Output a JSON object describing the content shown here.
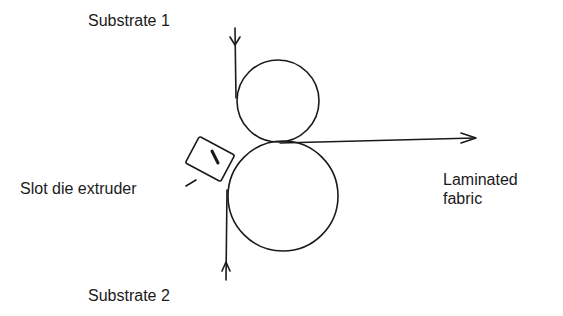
{
  "labels": {
    "substrate_1": "Substrate 1",
    "substrate_2": "Substrate 2",
    "slot_die_extruder": "Slot die extruder",
    "output_line1": "Laminated",
    "output_line2": "fabric"
  },
  "components": {
    "upper_roller": {
      "cx": 278,
      "cy": 101,
      "r": 41
    },
    "lower_roller": {
      "cx": 283,
      "cy": 196,
      "r": 55
    },
    "extruder": {
      "cx": 209,
      "cy": 158,
      "w": 40,
      "h": 30,
      "rotation_deg": 28
    }
  },
  "colors": {
    "stroke": "#1a1a1a",
    "background": "#ffffff"
  }
}
